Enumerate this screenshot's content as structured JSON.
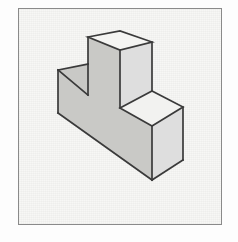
{
  "figure": {
    "background_color": "#fdfdfd",
    "plate_fill": "#f7f7f5",
    "frame": {
      "name": "figure-border",
      "x": 18,
      "y": 8,
      "width": 204,
      "height": 217,
      "stroke_color": "#8a8a8a",
      "stroke_width": 1.5
    },
    "object": {
      "name": "stepped-block",
      "shape": "L-shaped rectangular prism (single step)",
      "projection": "isometric",
      "edge_color": "#3a3a3a",
      "edge_width": 1.7,
      "faces": {
        "tall_top": {
          "label": "upper-top-face",
          "fill": "#f4f4f2",
          "points": "88,37 120,31 152,42 120,50"
        },
        "low_top": {
          "label": "lower-top-face",
          "fill": "#f2f2f0",
          "points": "120,108 152,91 183,107 152,126"
        },
        "step_top": {
          "label": "step-top-face",
          "fill": "#fbfbfa",
          "points": "58,70 88,64 88,95 58,70"
        },
        "left_front": {
          "label": "left-front-face",
          "fill": "#c9c9c6",
          "points": "58,70 88,64 88,95 120,108 120,50 88,37 88,64"
        },
        "right_front": {
          "label": "right-front-face",
          "fill": "#dedede",
          "points": "152,126 183,107 183,160 152,180"
        },
        "front_long": {
          "label": "front-long-face",
          "fill": "#c9c9c6",
          "points": "58,70 58,113 152,180 152,126 120,108"
        }
      },
      "vertices": {
        "tall_top_left": [
          88,
          37
        ],
        "tall_top_back": [
          120,
          31
        ],
        "tall_top_right": [
          152,
          42
        ],
        "tall_top_front": [
          120,
          50
        ],
        "step_back_left": [
          58,
          70
        ],
        "step_front_left": [
          88,
          64
        ],
        "step_inner": [
          88,
          95
        ],
        "low_top_left": [
          120,
          108
        ],
        "low_top_back": [
          152,
          91
        ],
        "low_top_right": [
          183,
          107
        ],
        "low_top_front": [
          152,
          126
        ],
        "bottom_left": [
          58,
          113
        ],
        "bottom_front": [
          152,
          180
        ],
        "bottom_right": [
          183,
          160
        ]
      }
    }
  }
}
